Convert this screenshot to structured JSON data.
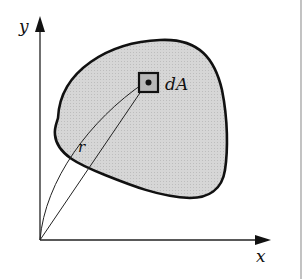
{
  "figure": {
    "axes": {
      "y_label": "y",
      "x_label": "x"
    },
    "labels": {
      "element_area": "dA",
      "radius": "r"
    },
    "colors": {
      "fill": "#d4d4d4",
      "stroke": "#111111",
      "background": "#ffffff"
    }
  }
}
